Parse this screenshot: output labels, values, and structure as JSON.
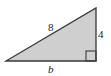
{
  "diagram": {
    "type": "right-triangle",
    "fill_color": "#cfcfcf",
    "stroke_color": "#3a3a3a",
    "vertices": {
      "bottom_left": [
        6,
        61
      ],
      "bottom_right": [
        96,
        61
      ],
      "top_right": [
        96,
        8
      ]
    },
    "right_angle_marker": {
      "x": 86,
      "y": 51,
      "size": 10
    },
    "labels": {
      "hypotenuse": "8",
      "vertical_leg": "4",
      "horizontal_leg": "b"
    }
  }
}
